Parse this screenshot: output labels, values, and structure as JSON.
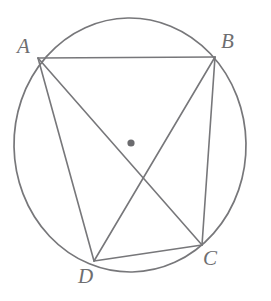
{
  "figure": {
    "type": "geometry-diagram",
    "canvas": {
      "width": 271,
      "height": 301
    },
    "style": {
      "stroke_color": "#77777a",
      "label_color": "#6e6e70",
      "background": "#ffffff",
      "stroke_width": 1.6,
      "center_dot_color": "#6b6b6e"
    },
    "circle": {
      "name": "circumcircle",
      "center": {
        "x": 130,
        "y": 145
      },
      "radius_x": 116,
      "radius_y": 127,
      "rotation": -1
    },
    "center_point": {
      "name": "circle-center",
      "x": 131,
      "y": 143,
      "radius": 3.6
    },
    "vertices": [
      {
        "id": "A",
        "label": "A",
        "x": 38,
        "y": 58,
        "label_x": 17,
        "label_y": 36
      },
      {
        "id": "B",
        "label": "B",
        "x": 215,
        "y": 57,
        "label_x": 221,
        "label_y": 31
      },
      {
        "id": "C",
        "label": "C",
        "x": 202,
        "y": 245,
        "label_x": 203,
        "label_y": 248
      },
      {
        "id": "D",
        "label": "D",
        "x": 94,
        "y": 261,
        "label_x": 78,
        "label_y": 266
      }
    ],
    "segments": [
      {
        "name": "side-AB",
        "from": "A",
        "to": "B",
        "kind": "side"
      },
      {
        "name": "side-BC",
        "from": "B",
        "to": "C",
        "kind": "side"
      },
      {
        "name": "side-CD",
        "from": "C",
        "to": "D",
        "kind": "side"
      },
      {
        "name": "side-DA",
        "from": "D",
        "to": "A",
        "kind": "side"
      },
      {
        "name": "diagonal-AC",
        "from": "A",
        "to": "C",
        "kind": "diagonal"
      },
      {
        "name": "diagonal-BD",
        "from": "B",
        "to": "D",
        "kind": "diagonal"
      }
    ]
  }
}
